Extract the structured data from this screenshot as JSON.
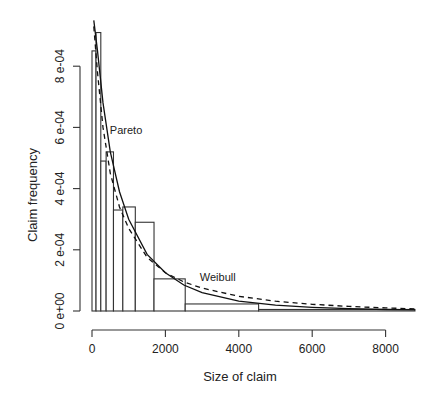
{
  "chart_data": {
    "type": "bar",
    "subtype": "histogram-with-density-curves",
    "title": "",
    "xlabel": "Size of claim",
    "ylabel": "Claim frequency",
    "xlim": [
      0,
      8800
    ],
    "ylim": [
      0,
      0.00095
    ],
    "x_ticks": [
      0,
      2000,
      4000,
      6000,
      8000
    ],
    "x_tick_labels": [
      "0",
      "2000",
      "4000",
      "6000",
      "8000"
    ],
    "y_ticks": [
      0,
      0.0002,
      0.0004,
      0.0006,
      0.0008
    ],
    "y_tick_labels": [
      "0 e+00",
      "2 e-04",
      "4 e-04",
      "6 e-04",
      "8 e-04"
    ],
    "grid": false,
    "legend": "none (curves labelled inline)",
    "bins": [
      {
        "x0": 0,
        "x1": 110,
        "density": 0.00085
      },
      {
        "x0": 110,
        "x1": 240,
        "density": 0.00091
      },
      {
        "x0": 240,
        "x1": 385,
        "density": 0.00049
      },
      {
        "x0": 385,
        "x1": 585,
        "density": 0.00052
      },
      {
        "x0": 585,
        "x1": 840,
        "density": 0.00033
      },
      {
        "x0": 840,
        "x1": 1180,
        "density": 0.00034
      },
      {
        "x0": 1180,
        "x1": 1690,
        "density": 0.00029
      },
      {
        "x0": 1690,
        "x1": 2540,
        "density": 0.000105
      },
      {
        "x0": 2540,
        "x1": 4540,
        "density": 2.3e-05
      },
      {
        "x0": 4540,
        "x1": 8800,
        "density": 5e-06
      }
    ],
    "series": [
      {
        "name": "Pareto",
        "style": "solid",
        "x": [
          50,
          150,
          300,
          500,
          750,
          1000,
          1500,
          2000,
          2500,
          3000,
          4000,
          5000,
          6000,
          7000,
          8000,
          8800
        ],
        "y": [
          0.00095,
          0.00085,
          0.00068,
          0.00052,
          0.00039,
          0.0003,
          0.000185,
          0.000125,
          8.5e-05,
          6e-05,
          3.2e-05,
          1.9e-05,
          1.2e-05,
          8e-06,
          5e-06,
          4e-06
        ]
      },
      {
        "name": "Weibull",
        "style": "dashed",
        "x": [
          50,
          150,
          300,
          500,
          750,
          1000,
          1500,
          2000,
          2500,
          3000,
          4000,
          5000,
          6000,
          7000,
          8000,
          8800
        ],
        "y": [
          0.00093,
          0.00078,
          0.0006,
          0.00045,
          0.00034,
          0.00027,
          0.000175,
          0.000125,
          9.5e-05,
          7.5e-05,
          4.8e-05,
          3.2e-05,
          2.2e-05,
          1.5e-05,
          1e-05,
          7e-06
        ]
      }
    ],
    "annotations": [
      {
        "text": "Pareto",
        "x": 650,
        "y": 0.00059
      },
      {
        "text": "Weibull",
        "x": 3100,
        "y": 0.00011
      }
    ]
  }
}
